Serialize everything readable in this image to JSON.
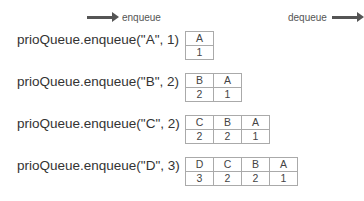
{
  "header": {
    "enqueue_label": "enqueue",
    "dequeue_label": "dequeue",
    "enqueue_icon": "arrow-right-icon",
    "dequeue_icon": "arrow-right-icon"
  },
  "steps": [
    {
      "call": "prioQueue.enqueue(\"A\", 1)",
      "values": [
        "A"
      ],
      "priorities": [
        "1"
      ]
    },
    {
      "call": "prioQueue.enqueue(\"B\", 2)",
      "values": [
        "B",
        "A"
      ],
      "priorities": [
        "2",
        "1"
      ]
    },
    {
      "call": "prioQueue.enqueue(\"C\", 2)",
      "values": [
        "C",
        "B",
        "A"
      ],
      "priorities": [
        "2",
        "2",
        "1"
      ]
    },
    {
      "call": "prioQueue.enqueue(\"D\", 3)",
      "values": [
        "D",
        "C",
        "B",
        "A"
      ],
      "priorities": [
        "3",
        "2",
        "2",
        "1"
      ]
    }
  ]
}
